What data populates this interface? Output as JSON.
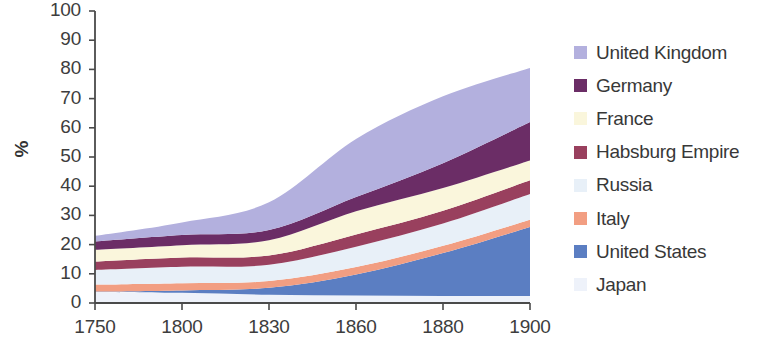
{
  "chart_data": {
    "type": "area",
    "stacked": true,
    "title": "",
    "subtitle": "",
    "xlabel": "",
    "ylabel": "%",
    "categories": [
      "1750",
      "1800",
      "1830",
      "1860",
      "1880",
      "1900"
    ],
    "x_tick_labels": [
      "1750",
      "1800",
      "1830",
      "1860",
      "1880",
      "1900"
    ],
    "y_tick_labels": [
      "0",
      "10",
      "20",
      "30",
      "40",
      "50",
      "60",
      "70",
      "80",
      "90",
      "100"
    ],
    "ylim": [
      0,
      100
    ],
    "ytick_step": 10,
    "grid": false,
    "legend_position": "right",
    "stack_order_bottom_to_top": [
      "Japan",
      "United States",
      "Italy",
      "Russia",
      "Habsburg Empire",
      "France",
      "Germany",
      "United Kingdom"
    ],
    "series": [
      {
        "name": "United Kingdom",
        "color": "#b3b0de",
        "values": [
          1.9,
          4.3,
          9.5,
          19.9,
          22.9,
          18.5
        ]
      },
      {
        "name": "Germany",
        "color": "#6b2d66",
        "values": [
          2.9,
          3.5,
          3.5,
          4.9,
          8.5,
          13.2
        ]
      },
      {
        "name": "France",
        "color": "#faf6dc",
        "values": [
          4.0,
          4.2,
          5.2,
          7.9,
          7.8,
          6.8
        ]
      },
      {
        "name": "Habsburg Empire",
        "color": "#99405e",
        "values": [
          2.9,
          3.2,
          3.2,
          4.2,
          4.4,
          4.7
        ]
      },
      {
        "name": "Russia",
        "color": "#e8f0f8",
        "values": [
          5.0,
          5.6,
          5.6,
          7.0,
          7.6,
          8.8
        ]
      },
      {
        "name": "Italy",
        "color": "#f29e82",
        "values": [
          2.4,
          2.5,
          2.3,
          2.5,
          2.5,
          2.5
        ]
      },
      {
        "name": "United States",
        "color": "#5b7ec2",
        "values": [
          0.1,
          0.8,
          2.4,
          7.2,
          14.7,
          23.6
        ]
      },
      {
        "name": "Japan",
        "color": "#eef2fa",
        "values": [
          3.8,
          3.5,
          2.8,
          2.6,
          2.4,
          2.4
        ]
      }
    ],
    "legend_entries": [
      {
        "label": "United Kingdom",
        "color": "#b3b0de"
      },
      {
        "label": "Germany",
        "color": "#6b2d66"
      },
      {
        "label": "France",
        "color": "#faf6dc"
      },
      {
        "label": "Habsburg Empire",
        "color": "#99405e"
      },
      {
        "label": "Russia",
        "color": "#e8f0f8"
      },
      {
        "label": "Italy",
        "color": "#f29e82"
      },
      {
        "label": "United States",
        "color": "#5b7ec2"
      },
      {
        "label": "Japan",
        "color": "#eef2fa"
      }
    ],
    "axis_color": "#4a4a4a",
    "background_color": "#ffffff"
  },
  "layout": {
    "plot_left": 95,
    "plot_right": 530,
    "plot_top": 11,
    "plot_bottom": 303
  }
}
